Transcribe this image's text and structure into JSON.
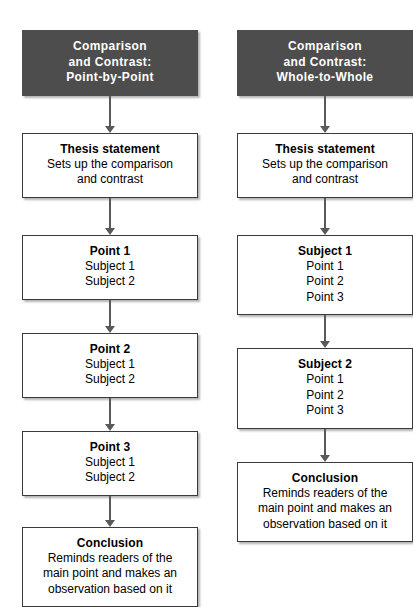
{
  "diagram": {
    "colors": {
      "header_background": "#4d4d4d",
      "header_text": "#ffffff",
      "box_background": "#ffffff",
      "box_border": "#3a3a3a",
      "arrow": "#595959",
      "body_text": "#000000"
    },
    "columns": [
      {
        "id": "point-by-point",
        "header": {
          "lines": [
            "Comparison",
            "and Contrast:",
            "Point-by-Point"
          ]
        },
        "nodes": [
          {
            "id": "thesis",
            "title": "Thesis statement",
            "lines": [
              "Sets up the comparison",
              "and contrast"
            ]
          },
          {
            "id": "point-1",
            "title": "Point 1",
            "lines": [
              "Subject 1",
              "Subject 2"
            ]
          },
          {
            "id": "point-2",
            "title": "Point 2",
            "lines": [
              "Subject 1",
              "Subject 2"
            ]
          },
          {
            "id": "point-3",
            "title": "Point 3",
            "lines": [
              "Subject 1",
              "Subject 2"
            ]
          },
          {
            "id": "conclusion",
            "title": "Conclusion",
            "lines": [
              "Reminds readers of the",
              "main point and makes an",
              "observation based on it"
            ]
          }
        ]
      },
      {
        "id": "whole-to-whole",
        "header": {
          "lines": [
            "Comparison",
            "and Contrast:",
            "Whole-to-Whole"
          ]
        },
        "nodes": [
          {
            "id": "thesis",
            "title": "Thesis statement",
            "lines": [
              "Sets up the comparison",
              "and contrast"
            ]
          },
          {
            "id": "subject-1",
            "title": "Subject 1",
            "lines": [
              "Point 1",
              "Point 2",
              "Point 3"
            ]
          },
          {
            "id": "subject-2",
            "title": "Subject 2",
            "lines": [
              "Point 1",
              "Point 2",
              "Point 3"
            ]
          },
          {
            "id": "conclusion",
            "title": "Conclusion",
            "lines": [
              "Reminds readers of the",
              "main point and makes an",
              "observation based on it"
            ]
          }
        ]
      }
    ]
  }
}
